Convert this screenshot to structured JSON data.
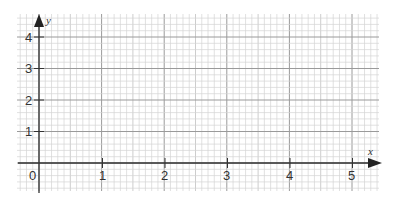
{
  "graph": {
    "x_axis": {
      "label": "x",
      "ticks": [
        "0",
        "1",
        "2",
        "3",
        "4",
        "5"
      ]
    },
    "y_axis": {
      "label": "y",
      "ticks": [
        "1",
        "2",
        "3",
        "4"
      ]
    },
    "grid": {
      "x_units": 5,
      "y_units": 4,
      "x_minor_per_unit": 10,
      "y_minor_per_unit": 5
    },
    "colors": {
      "minor_grid": "#d4d4d4",
      "major_grid": "#9a9a9a",
      "axis": "#333333"
    }
  }
}
